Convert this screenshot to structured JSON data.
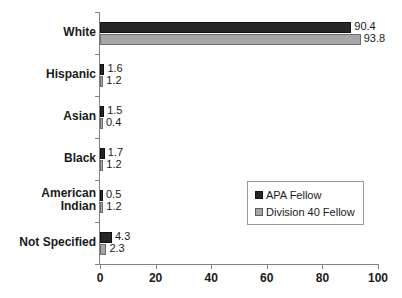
{
  "chart_data": {
    "type": "bar",
    "orientation": "horizontal",
    "title": "",
    "xlabel": "",
    "ylabel": "",
    "xlim": [
      0,
      100
    ],
    "xticks": [
      0,
      20,
      40,
      60,
      80,
      100
    ],
    "grid": false,
    "legend_position": "inside-lower-right",
    "categories": [
      "White",
      "Hispanic",
      "Asian",
      "Black",
      "American Indian",
      "Not Specified"
    ],
    "category_labels_wrapped": [
      [
        "White"
      ],
      [
        "Hispanic"
      ],
      [
        "Asian"
      ],
      [
        "Black"
      ],
      [
        "American",
        "Indian"
      ],
      [
        "Not Specified"
      ]
    ],
    "series": [
      {
        "name": "APA Fellow",
        "color": "#262626",
        "values": [
          90.4,
          1.6,
          1.5,
          1.7,
          0.5,
          4.3
        ],
        "value_labels": [
          "90.4",
          "1.6",
          "1.5",
          "1.7",
          "0.5",
          "4.3"
        ]
      },
      {
        "name": "Division 40 Fellow",
        "color": "#a6a6a6",
        "values": [
          93.8,
          1.2,
          0.4,
          1.2,
          1.2,
          2.3
        ],
        "value_labels": [
          "93.8",
          "1.2",
          "0.4",
          "1.2",
          "1.2",
          "2.3"
        ]
      }
    ]
  },
  "axis": {
    "tick_labels": [
      "0",
      "20",
      "40",
      "60",
      "80",
      "100"
    ]
  },
  "legend": {
    "entries": [
      {
        "label": "APA Fellow"
      },
      {
        "label": "Division 40 Fellow"
      }
    ]
  }
}
